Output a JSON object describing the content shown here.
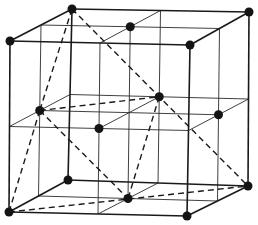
{
  "diagram": {
    "title": "",
    "type": "fcc-unit-cell-with-tetrahedron",
    "colors": {
      "background": "#ffffff",
      "lines": "#1a1a1a",
      "atoms": "#141414"
    },
    "corners": {
      "front_top_left": [
        10,
        41
      ],
      "front_top_right": [
        190,
        45
      ],
      "front_bottom_left": [
        9,
        212
      ],
      "front_bottom_right": [
        187,
        216
      ],
      "back_top_left": [
        72,
        9
      ],
      "back_top_right": [
        249,
        12
      ],
      "back_bottom_left": [
        68,
        180
      ],
      "back_bottom_right": [
        248,
        186
      ]
    },
    "grid_divisions": 2,
    "atom_radius": 4.5,
    "atoms": [
      {
        "name": "corner-front-top-left",
        "pos": [
          0,
          0,
          0
        ]
      },
      {
        "name": "corner-front-top-right",
        "pos": [
          1,
          0,
          0
        ]
      },
      {
        "name": "corner-front-bottom-left",
        "pos": [
          0,
          1,
          0
        ]
      },
      {
        "name": "corner-front-bottom-right",
        "pos": [
          1,
          1,
          0
        ]
      },
      {
        "name": "corner-back-top-left",
        "pos": [
          0,
          0,
          1
        ]
      },
      {
        "name": "corner-back-top-right",
        "pos": [
          1,
          0,
          1
        ]
      },
      {
        "name": "corner-back-bottom-left",
        "pos": [
          0,
          1,
          1
        ]
      },
      {
        "name": "corner-back-bottom-right",
        "pos": [
          1,
          1,
          1
        ]
      },
      {
        "name": "face-center-top",
        "pos": [
          0.5,
          0,
          0.5
        ]
      },
      {
        "name": "face-center-bottom",
        "pos": [
          0.5,
          1,
          0.5
        ]
      },
      {
        "name": "face-center-left",
        "pos": [
          0,
          0.5,
          0.5
        ]
      },
      {
        "name": "face-center-right",
        "pos": [
          1,
          0.5,
          0.5
        ]
      },
      {
        "name": "face-center-front",
        "pos": [
          0.5,
          0.5,
          0
        ]
      },
      {
        "name": "face-center-back",
        "pos": [
          0.5,
          0.5,
          1
        ]
      }
    ],
    "dashed_edges": [
      {
        "name": "tetra-edge-1",
        "from": [
          0,
          0,
          1
        ],
        "to": [
          0,
          0.5,
          0.5
        ]
      },
      {
        "name": "tetra-edge-2",
        "from": [
          0,
          0,
          1
        ],
        "to": [
          1,
          1,
          1
        ]
      },
      {
        "name": "tetra-edge-3",
        "from": [
          0,
          0.5,
          0.5
        ],
        "to": [
          0.5,
          0.5,
          1
        ]
      },
      {
        "name": "tetra-edge-4",
        "from": [
          0,
          0.5,
          0.5
        ],
        "to": [
          0,
          1,
          0
        ]
      },
      {
        "name": "tetra-edge-5",
        "from": [
          0,
          0.5,
          0.5
        ],
        "to": [
          0.5,
          1,
          0.5
        ]
      },
      {
        "name": "tetra-edge-6",
        "from": [
          0.5,
          0.5,
          1
        ],
        "to": [
          0.5,
          1,
          0.5
        ]
      },
      {
        "name": "tetra-edge-7",
        "from": [
          0,
          1,
          0
        ],
        "to": [
          1,
          1,
          1
        ]
      }
    ]
  }
}
